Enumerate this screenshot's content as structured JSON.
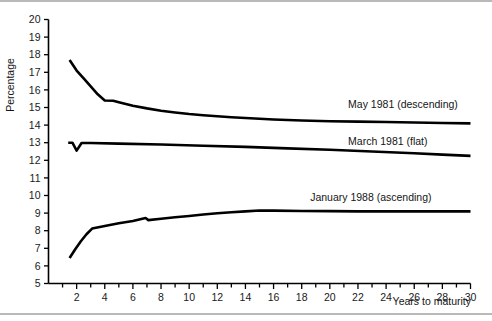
{
  "chart_data": {
    "type": "line",
    "title": "",
    "subtitle": "",
    "xlabel": "Years to maturity",
    "ylabel": "Percentage",
    "xlim": [
      0,
      30
    ],
    "ylim": [
      5,
      20
    ],
    "grid": false,
    "legend_position": "inline-right-of-curve",
    "x_ticks": [
      2,
      4,
      6,
      8,
      10,
      12,
      14,
      16,
      18,
      20,
      22,
      24,
      26,
      28,
      30
    ],
    "x_minor_ticks": [
      1,
      3,
      5,
      7,
      9,
      11,
      13,
      15,
      17,
      19,
      21,
      23,
      25,
      27,
      29
    ],
    "y_ticks": [
      5,
      6,
      7,
      8,
      9,
      10,
      11,
      12,
      13,
      14,
      15,
      16,
      17,
      18,
      19,
      20
    ],
    "series": [
      {
        "name": "May 1981 (descending)",
        "label": "May 1981 (descending)",
        "color": "#000000",
        "shape": "descending",
        "label_x": 21.3,
        "label_y": 15.0,
        "points": [
          {
            "x": 1.5,
            "y": 17.7
          },
          {
            "x": 2.0,
            "y": 17.1
          },
          {
            "x": 2.5,
            "y": 16.65
          },
          {
            "x": 3.0,
            "y": 16.2
          },
          {
            "x": 3.5,
            "y": 15.75
          },
          {
            "x": 4.0,
            "y": 15.4
          },
          {
            "x": 4.6,
            "y": 15.38
          },
          {
            "x": 5.0,
            "y": 15.3
          },
          {
            "x": 6.0,
            "y": 15.1
          },
          {
            "x": 7.0,
            "y": 14.95
          },
          {
            "x": 8.0,
            "y": 14.82
          },
          {
            "x": 9.0,
            "y": 14.72
          },
          {
            "x": 10.0,
            "y": 14.63
          },
          {
            "x": 11.0,
            "y": 14.56
          },
          {
            "x": 12.0,
            "y": 14.5
          },
          {
            "x": 13.0,
            "y": 14.45
          },
          {
            "x": 14.0,
            "y": 14.4
          },
          {
            "x": 15.0,
            "y": 14.36
          },
          {
            "x": 16.0,
            "y": 14.32
          },
          {
            "x": 18.0,
            "y": 14.26
          },
          {
            "x": 20.0,
            "y": 14.22
          },
          {
            "x": 22.0,
            "y": 14.2
          },
          {
            "x": 24.0,
            "y": 14.18
          },
          {
            "x": 26.0,
            "y": 14.15
          },
          {
            "x": 28.0,
            "y": 14.12
          },
          {
            "x": 30.0,
            "y": 14.1
          }
        ]
      },
      {
        "name": "March 1981 (flat)",
        "label": "March 1981 (flat)",
        "color": "#000000",
        "shape": "flat",
        "label_x": 21.3,
        "label_y": 12.85,
        "points": [
          {
            "x": 1.4,
            "y": 13.0
          },
          {
            "x": 1.7,
            "y": 13.0
          },
          {
            "x": 2.0,
            "y": 12.55
          },
          {
            "x": 2.35,
            "y": 12.98
          },
          {
            "x": 3.0,
            "y": 12.98
          },
          {
            "x": 5.0,
            "y": 12.95
          },
          {
            "x": 8.0,
            "y": 12.9
          },
          {
            "x": 11.0,
            "y": 12.83
          },
          {
            "x": 14.0,
            "y": 12.76
          },
          {
            "x": 17.0,
            "y": 12.68
          },
          {
            "x": 20.0,
            "y": 12.6
          },
          {
            "x": 23.0,
            "y": 12.5
          },
          {
            "x": 26.0,
            "y": 12.4
          },
          {
            "x": 28.0,
            "y": 12.32
          },
          {
            "x": 30.0,
            "y": 12.25
          }
        ]
      },
      {
        "name": "January 1988 (ascending)",
        "label": "January 1988 (ascending)",
        "color": "#000000",
        "shape": "ascending",
        "label_x": 18.6,
        "label_y": 9.7,
        "points": [
          {
            "x": 1.5,
            "y": 6.45
          },
          {
            "x": 1.9,
            "y": 6.95
          },
          {
            "x": 2.3,
            "y": 7.4
          },
          {
            "x": 2.7,
            "y": 7.8
          },
          {
            "x": 3.1,
            "y": 8.12
          },
          {
            "x": 4.0,
            "y": 8.27
          },
          {
            "x": 5.0,
            "y": 8.42
          },
          {
            "x": 6.0,
            "y": 8.55
          },
          {
            "x": 6.9,
            "y": 8.72
          },
          {
            "x": 7.1,
            "y": 8.6
          },
          {
            "x": 8.0,
            "y": 8.68
          },
          {
            "x": 9.0,
            "y": 8.76
          },
          {
            "x": 10.0,
            "y": 8.84
          },
          {
            "x": 11.0,
            "y": 8.92
          },
          {
            "x": 12.0,
            "y": 8.99
          },
          {
            "x": 13.0,
            "y": 9.05
          },
          {
            "x": 14.0,
            "y": 9.1
          },
          {
            "x": 15.0,
            "y": 9.15
          },
          {
            "x": 16.0,
            "y": 9.14
          },
          {
            "x": 18.0,
            "y": 9.12
          },
          {
            "x": 20.0,
            "y": 9.11
          },
          {
            "x": 22.0,
            "y": 9.1
          },
          {
            "x": 25.0,
            "y": 9.1
          },
          {
            "x": 28.0,
            "y": 9.1
          },
          {
            "x": 30.0,
            "y": 9.1
          }
        ]
      }
    ]
  }
}
